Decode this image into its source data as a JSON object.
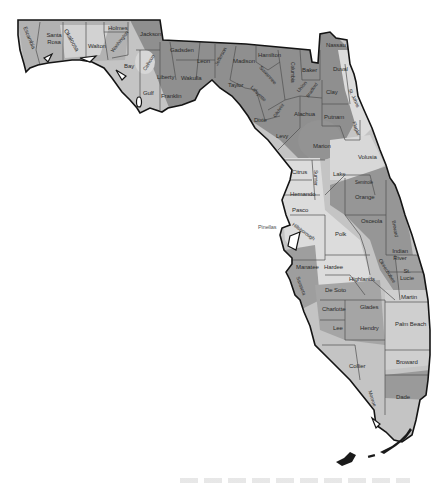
{
  "map": {
    "title": "Florida counties",
    "colors": {
      "dark": "#8f8f8f",
      "medium": "#a9a9a9",
      "light": "#c9c9c9",
      "lightest": "#e1e1e1",
      "border": "#1a1a1a",
      "county_line": "#555555",
      "background": "#ffffff"
    },
    "counties": [
      {
        "name": "Escambia"
      },
      {
        "name": "Santa Rosa"
      },
      {
        "name": "Okaloosa"
      },
      {
        "name": "Walton"
      },
      {
        "name": "Holmes"
      },
      {
        "name": "Washington"
      },
      {
        "name": "Jackson"
      },
      {
        "name": "Bay"
      },
      {
        "name": "Calhoun"
      },
      {
        "name": "Gulf"
      },
      {
        "name": "Liberty"
      },
      {
        "name": "Gadsden"
      },
      {
        "name": "Franklin"
      },
      {
        "name": "Wakulla"
      },
      {
        "name": "Leon"
      },
      {
        "name": "Jefferson"
      },
      {
        "name": "Madison"
      },
      {
        "name": "Taylor"
      },
      {
        "name": "Hamilton"
      },
      {
        "name": "Suwannee"
      },
      {
        "name": "Lafayette"
      },
      {
        "name": "Columbia"
      },
      {
        "name": "Dixie"
      },
      {
        "name": "Gilchrist"
      },
      {
        "name": "Union"
      },
      {
        "name": "Bradford"
      },
      {
        "name": "Baker"
      },
      {
        "name": "Nassau"
      },
      {
        "name": "Duval"
      },
      {
        "name": "Clay"
      },
      {
        "name": "St. Johns"
      },
      {
        "name": "Alachua"
      },
      {
        "name": "Putnam"
      },
      {
        "name": "Flagler"
      },
      {
        "name": "Levy"
      },
      {
        "name": "Marion"
      },
      {
        "name": "Volusia"
      },
      {
        "name": "Citrus"
      },
      {
        "name": "Sumter"
      },
      {
        "name": "Lake"
      },
      {
        "name": "Seminole"
      },
      {
        "name": "Orange"
      },
      {
        "name": "Hernando"
      },
      {
        "name": "Pasco"
      },
      {
        "name": "Pinellas"
      },
      {
        "name": "Hillsborough"
      },
      {
        "name": "Polk"
      },
      {
        "name": "Osceola"
      },
      {
        "name": "Brevard"
      },
      {
        "name": "Indian River"
      },
      {
        "name": "Manatee"
      },
      {
        "name": "Hardee"
      },
      {
        "name": "Highlands"
      },
      {
        "name": "Okeechobee"
      },
      {
        "name": "St. Lucie"
      },
      {
        "name": "Sarasota"
      },
      {
        "name": "De Soto"
      },
      {
        "name": "Charlotte"
      },
      {
        "name": "Glades"
      },
      {
        "name": "Martin"
      },
      {
        "name": "Lee"
      },
      {
        "name": "Hendry"
      },
      {
        "name": "Palm Beach"
      },
      {
        "name": "Collier"
      },
      {
        "name": "Broward"
      },
      {
        "name": "Monroe"
      },
      {
        "name": "Dade"
      }
    ]
  }
}
